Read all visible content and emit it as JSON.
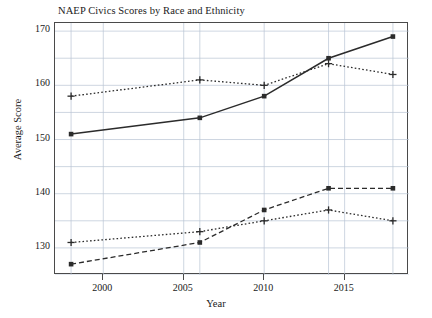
{
  "chart_data": {
    "type": "line",
    "title": "NAEP Civics Scores by Race and Ethnicity",
    "xlabel": "Year",
    "ylabel": "Average Score",
    "xlim": [
      1997,
      2019
    ],
    "ylim": [
      125,
      171.5
    ],
    "xticks": [
      2000,
      2005,
      2010,
      2015
    ],
    "yticks": [
      130,
      140,
      150,
      160,
      170
    ],
    "grid": true,
    "grid_minor_step": 5,
    "legend": "none",
    "x": [
      1998,
      2006,
      2010,
      2014,
      2018
    ],
    "series": [
      {
        "name": "series-solid-square",
        "style": "solid",
        "marker": "square",
        "color": "#2b2b2b",
        "values": [
          151,
          154,
          158,
          165,
          169
        ]
      },
      {
        "name": "series-dotted-plus-upper",
        "style": "dotted",
        "marker": "plus",
        "color": "#2b2b2b",
        "values": [
          158,
          161,
          160,
          164,
          162
        ]
      },
      {
        "name": "series-dotted-plus-lower",
        "style": "dotted",
        "marker": "plus",
        "color": "#2b2b2b",
        "values": [
          131,
          133,
          135,
          137,
          135
        ]
      },
      {
        "name": "series-dashed-square-lower",
        "style": "dashed",
        "marker": "square",
        "color": "#2b2b2b",
        "values": [
          127,
          131,
          137,
          141,
          141
        ]
      }
    ]
  },
  "colors": {
    "ink": "#2b2b2b",
    "axis": "#4a4a4a",
    "grid": "#b9c4d4",
    "background": "#ffffff"
  }
}
